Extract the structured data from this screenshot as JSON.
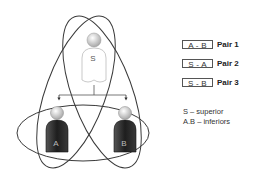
{
  "diagram": {
    "nodes": [
      {
        "id": "S",
        "label": "S",
        "role": "superior"
      },
      {
        "id": "A",
        "label": "A",
        "role": "inferior"
      },
      {
        "id": "B",
        "label": "B",
        "role": "inferior"
      }
    ],
    "edges": [
      {
        "from": "S",
        "to": "A",
        "type": "arrow"
      },
      {
        "from": "S",
        "to": "B",
        "type": "arrow"
      }
    ],
    "groupings": [
      {
        "name": "Pair 1",
        "members": [
          "A",
          "B"
        ],
        "shape": "horizontal-ellipse"
      },
      {
        "name": "Pair 2",
        "members": [
          "S",
          "A"
        ],
        "shape": "tilted-ellipse"
      },
      {
        "name": "Pair 3",
        "members": [
          "S",
          "B"
        ],
        "shape": "tilted-ellipse"
      }
    ]
  },
  "legend": {
    "pairs": [
      {
        "box": "A - B",
        "label": "Pair 1"
      },
      {
        "box": "S - A",
        "label": "Pair 2"
      },
      {
        "box": "S - B",
        "label": "Pair 3"
      }
    ],
    "notes": [
      "S – superior",
      "A.B – inferiors"
    ]
  },
  "colors": {
    "line": "#3a3a3a",
    "superior_fill": "#ffffff",
    "inferior_body": "#2e2e2e",
    "head": "#d8d8d8"
  }
}
